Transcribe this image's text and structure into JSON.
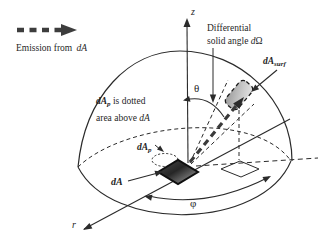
{
  "figure_type": "hemisphere solid-angle emission diagram",
  "colors": {
    "ink": "#2b2b2b",
    "emission_ray": "#3a3a3a",
    "surface_patch_light": "#e0e0e0",
    "surface_patch_dark": "#969696",
    "emitting_area_dark": "#262626",
    "emitting_area_light": "#ababab"
  },
  "legend": {
    "icon": "dashed-emission-arrow",
    "text": "Emission from ",
    "emphasis": "dA"
  },
  "axes": {
    "z": "z",
    "r": "r"
  },
  "angles": {
    "theta": "θ",
    "phi": "φ"
  },
  "solid_angle_callout": {
    "line1": "Differential",
    "line2_text": "solid angle ",
    "line2_d": "d",
    "line2_omega": "Ω"
  },
  "labels": {
    "surface_area_main": "dA",
    "surface_area_sub": "surf",
    "projected_area_main": "dA",
    "projected_area_sub": "p",
    "emitting_area": "dA"
  },
  "projection_note": {
    "line1_main": "dA",
    "line1_sub": "p",
    "line1_rest": " is dotted",
    "line2_text": "area above ",
    "line2_em": "dA"
  }
}
